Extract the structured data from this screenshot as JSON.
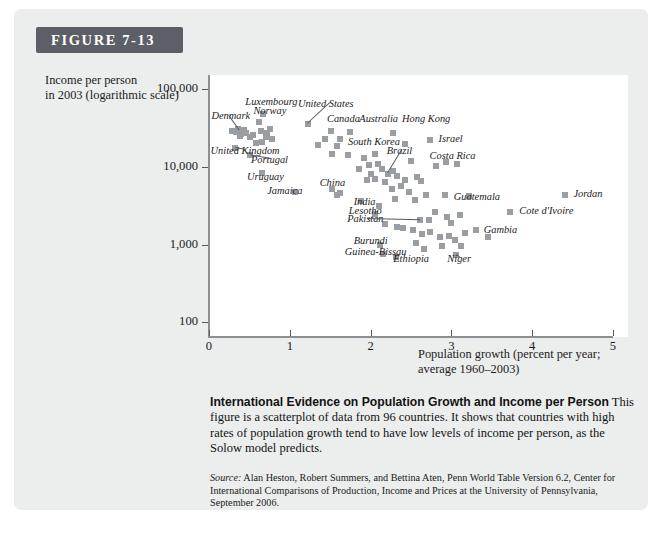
{
  "figure": {
    "badge_label": "FIGURE 7-13",
    "y_axis_title_line1": "Income per person",
    "y_axis_title_line2": "in 2003 (logarithmic scale)",
    "x_axis_title_line1": "Population growth (percent per year;",
    "x_axis_title_line2": "average 1960–2003)"
  },
  "caption": {
    "headline": "International Evidence on Population Growth and Income per Person",
    "body": " This figure is a scatterplot of data from 96 countries. It shows that countries with high rates of population growth tend to have low levels of income per person, as the Solow model predicts.",
    "source_label": "Source:",
    "source_body": " Alan Heston, Robert Summers, and Bettina Aten, Penn World Table Version 6.2, Center for International Comparisons of Production, Income and Prices at the University of Pennsylvania, September 2006."
  },
  "chart_data": {
    "type": "scatter",
    "title": "International Evidence on Population Growth and Income per Person",
    "xlabel": "Population growth (percent per year; average 1960-2003)",
    "ylabel": "Income per person in 2003 (logarithmic scale)",
    "xlim": [
      0,
      5
    ],
    "ylim": [
      100,
      100000
    ],
    "yscale": "log",
    "grid": false,
    "legend": null,
    "n_countries": 96,
    "xticks": [
      0,
      1,
      2,
      3,
      4,
      5
    ],
    "xtick_labels": [
      "0",
      "1",
      "2",
      "3",
      "4",
      "5"
    ],
    "yticks": [
      100,
      1000,
      10000,
      100000
    ],
    "ytick_labels": [
      "100",
      "1,000",
      "10,000",
      "100,000"
    ],
    "marker": "square",
    "marker_color": "#9a9da1",
    "labeled_points": [
      {
        "name": "Denmark",
        "x": 0.38,
        "y": 30000,
        "lx": 0.03,
        "ly": 44000,
        "leader": true
      },
      {
        "name": "Luxembourg",
        "x": 0.67,
        "y": 48000,
        "lx": 0.45,
        "ly": 66000,
        "leader": false
      },
      {
        "name": "Norway",
        "x": 0.62,
        "y": 38000,
        "lx": 0.55,
        "ly": 50000,
        "leader": false
      },
      {
        "name": "United States",
        "x": 1.23,
        "y": 36000,
        "lx": 1.1,
        "ly": 62000,
        "leader": true
      },
      {
        "name": "Canada",
        "x": 1.51,
        "y": 29000,
        "lx": 1.46,
        "ly": 40000,
        "leader": false
      },
      {
        "name": "Australia",
        "x": 1.74,
        "y": 28000,
        "lx": 1.86,
        "ly": 40000,
        "leader": false
      },
      {
        "name": "Hong Kong",
        "x": 2.28,
        "y": 27000,
        "lx": 2.39,
        "ly": 40000,
        "leader": false
      },
      {
        "name": "Israel",
        "x": 2.73,
        "y": 22000,
        "lx": 2.84,
        "ly": 22000,
        "leader": false
      },
      {
        "name": "United Kingdom",
        "x": 0.32,
        "y": 17500,
        "lx": 0.02,
        "ly": 15500,
        "leader": true
      },
      {
        "name": "Portugal",
        "x": 0.51,
        "y": 14000,
        "lx": 0.52,
        "ly": 11800,
        "leader": true
      },
      {
        "name": "South Korea",
        "x": 1.59,
        "y": 18500,
        "lx": 1.72,
        "ly": 20000,
        "leader": false
      },
      {
        "name": "Brazil",
        "x": 2.21,
        "y": 8200,
        "lx": 2.2,
        "ly": 15500,
        "leader": true
      },
      {
        "name": "Costa Rica",
        "x": 2.81,
        "y": 10200,
        "lx": 2.73,
        "ly": 13200,
        "leader": false
      },
      {
        "name": "Uruguay",
        "x": 0.65,
        "y": 8400,
        "lx": 0.47,
        "ly": 7100,
        "leader": false
      },
      {
        "name": "Jamaica",
        "x": 1.07,
        "y": 4800,
        "lx": 0.72,
        "ly": 4800,
        "leader": false
      },
      {
        "name": "China",
        "x": 1.52,
        "y": 5200,
        "lx": 1.37,
        "ly": 6000,
        "leader": false
      },
      {
        "name": "India",
        "x": 2.1,
        "y": 3150,
        "lx": 1.79,
        "ly": 3400,
        "leader": false
      },
      {
        "name": "Guatemala",
        "x": 2.93,
        "y": 4000,
        "lx": 3.03,
        "ly": 4000,
        "leader": false
      },
      {
        "name": "Jordan",
        "x": 4.4,
        "y": 4300,
        "lx": 4.51,
        "ly": 4300,
        "leader": false
      },
      {
        "name": "Cote d'Ivoire",
        "x": 3.73,
        "y": 2600,
        "lx": 3.84,
        "ly": 2600,
        "leader": false
      },
      {
        "name": "Lesotho",
        "x": 2.05,
        "y": 2500,
        "lx": 1.73,
        "ly": 2650,
        "leader": false
      },
      {
        "name": "Pakistan",
        "x": 2.61,
        "y": 2100,
        "lx": 1.71,
        "ly": 2050,
        "leader": true
      },
      {
        "name": "Gambia",
        "x": 3.31,
        "y": 1550,
        "lx": 3.4,
        "ly": 1500,
        "leader": false
      },
      {
        "name": "Burundi",
        "x": 2.12,
        "y": 1000,
        "lx": 1.79,
        "ly": 1080,
        "leader": false
      },
      {
        "name": "Guinea-Bissau",
        "x": 2.15,
        "y": 760,
        "lx": 1.68,
        "ly": 790,
        "leader": false
      },
      {
        "name": "Ethiopia",
        "x": 2.32,
        "y": 700,
        "lx": 2.28,
        "ly": 640,
        "leader": false
      },
      {
        "name": "Niger",
        "x": 3.06,
        "y": 730,
        "lx": 2.95,
        "ly": 630,
        "leader": true
      }
    ],
    "points": [
      {
        "x": 0.28,
        "y": 29000
      },
      {
        "x": 0.34,
        "y": 28000
      },
      {
        "x": 0.36,
        "y": 31000
      },
      {
        "x": 0.4,
        "y": 26500
      },
      {
        "x": 0.43,
        "y": 30000
      },
      {
        "x": 0.46,
        "y": 27500
      },
      {
        "x": 0.38,
        "y": 25000
      },
      {
        "x": 0.32,
        "y": 17500
      },
      {
        "x": 0.51,
        "y": 24500
      },
      {
        "x": 0.55,
        "y": 26000
      },
      {
        "x": 0.62,
        "y": 38000
      },
      {
        "x": 0.67,
        "y": 48000
      },
      {
        "x": 0.64,
        "y": 29000
      },
      {
        "x": 0.72,
        "y": 27500
      },
      {
        "x": 0.75,
        "y": 31000
      },
      {
        "x": 0.7,
        "y": 24000
      },
      {
        "x": 0.78,
        "y": 23000
      },
      {
        "x": 0.66,
        "y": 21000
      },
      {
        "x": 0.58,
        "y": 20000
      },
      {
        "x": 0.51,
        "y": 14000
      },
      {
        "x": 0.65,
        "y": 8400
      },
      {
        "x": 1.07,
        "y": 4800
      },
      {
        "x": 1.23,
        "y": 36000
      },
      {
        "x": 1.51,
        "y": 29000
      },
      {
        "x": 1.74,
        "y": 28000
      },
      {
        "x": 2.28,
        "y": 27000
      },
      {
        "x": 1.44,
        "y": 23000
      },
      {
        "x": 1.62,
        "y": 22500
      },
      {
        "x": 2.73,
        "y": 22000
      },
      {
        "x": 1.35,
        "y": 19000
      },
      {
        "x": 1.59,
        "y": 18500
      },
      {
        "x": 2.42,
        "y": 19500
      },
      {
        "x": 1.52,
        "y": 14500
      },
      {
        "x": 1.72,
        "y": 14000
      },
      {
        "x": 2.05,
        "y": 14500
      },
      {
        "x": 1.92,
        "y": 12800
      },
      {
        "x": 2.5,
        "y": 12000
      },
      {
        "x": 2.93,
        "y": 11500
      },
      {
        "x": 2.81,
        "y": 10200
      },
      {
        "x": 3.07,
        "y": 10800
      },
      {
        "x": 1.52,
        "y": 5200
      },
      {
        "x": 1.62,
        "y": 4600
      },
      {
        "x": 1.58,
        "y": 4300
      },
      {
        "x": 1.86,
        "y": 9500
      },
      {
        "x": 1.98,
        "y": 10500
      },
      {
        "x": 2.09,
        "y": 11000
      },
      {
        "x": 2.14,
        "y": 9500
      },
      {
        "x": 2.0,
        "y": 8200
      },
      {
        "x": 2.21,
        "y": 8200
      },
      {
        "x": 2.28,
        "y": 8800
      },
      {
        "x": 2.33,
        "y": 7600
      },
      {
        "x": 2.06,
        "y": 7000
      },
      {
        "x": 1.96,
        "y": 6800
      },
      {
        "x": 2.18,
        "y": 6400
      },
      {
        "x": 2.43,
        "y": 6800
      },
      {
        "x": 2.57,
        "y": 7400
      },
      {
        "x": 2.62,
        "y": 6600
      },
      {
        "x": 2.38,
        "y": 5600
      },
      {
        "x": 2.26,
        "y": 5200
      },
      {
        "x": 2.47,
        "y": 4800
      },
      {
        "x": 2.1,
        "y": 3150
      },
      {
        "x": 2.05,
        "y": 2500
      },
      {
        "x": 1.88,
        "y": 3600
      },
      {
        "x": 2.3,
        "y": 3900
      },
      {
        "x": 2.55,
        "y": 3700
      },
      {
        "x": 2.68,
        "y": 4400
      },
      {
        "x": 2.92,
        "y": 4300
      },
      {
        "x": 3.22,
        "y": 4200
      },
      {
        "x": 4.4,
        "y": 4300
      },
      {
        "x": 2.61,
        "y": 2100
      },
      {
        "x": 2.8,
        "y": 2600
      },
      {
        "x": 2.72,
        "y": 2050
      },
      {
        "x": 2.95,
        "y": 2250
      },
      {
        "x": 3.0,
        "y": 1900
      },
      {
        "x": 3.11,
        "y": 2400
      },
      {
        "x": 3.73,
        "y": 2600
      },
      {
        "x": 2.18,
        "y": 1850
      },
      {
        "x": 2.33,
        "y": 1700
      },
      {
        "x": 2.4,
        "y": 1650
      },
      {
        "x": 2.52,
        "y": 1550
      },
      {
        "x": 2.63,
        "y": 1350
      },
      {
        "x": 2.74,
        "y": 1450
      },
      {
        "x": 2.86,
        "y": 1250
      },
      {
        "x": 2.97,
        "y": 1300
      },
      {
        "x": 3.04,
        "y": 1150
      },
      {
        "x": 3.17,
        "y": 1400
      },
      {
        "x": 3.31,
        "y": 1550
      },
      {
        "x": 3.45,
        "y": 1250
      },
      {
        "x": 2.12,
        "y": 1000
      },
      {
        "x": 2.15,
        "y": 760
      },
      {
        "x": 2.32,
        "y": 700
      },
      {
        "x": 3.06,
        "y": 730
      },
      {
        "x": 2.66,
        "y": 880
      },
      {
        "x": 2.88,
        "y": 950
      },
      {
        "x": 3.12,
        "y": 960
      },
      {
        "x": 2.56,
        "y": 1050
      }
    ]
  }
}
